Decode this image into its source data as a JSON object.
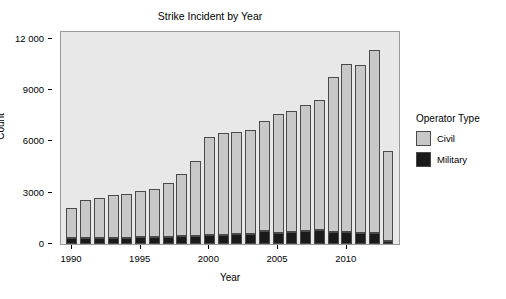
{
  "chart_data": {
    "type": "bar",
    "title": "Strike Incident by Year",
    "xlabel": "Year",
    "ylabel": "Count",
    "stacked": true,
    "grid": false,
    "xlim": [
      1989.2,
      2013.8
    ],
    "ylim": [
      0,
      12400
    ],
    "yticks": [
      0,
      3000,
      6000,
      9000,
      12000
    ],
    "ytick_labels": [
      "0",
      "3000",
      "6000",
      "9000",
      "12 000"
    ],
    "xticks": [
      1990,
      1995,
      2000,
      2005,
      2010
    ],
    "xtick_labels": [
      "1990",
      "1995",
      "2000",
      "2005",
      "2010"
    ],
    "categories": [
      1990,
      1991,
      1992,
      1993,
      1994,
      1995,
      1996,
      1997,
      1998,
      1999,
      2000,
      2001,
      2002,
      2003,
      2004,
      2005,
      2006,
      2007,
      2008,
      2009,
      2010,
      2011,
      2012,
      2013
    ],
    "series": [
      {
        "name": "Military",
        "color": "#1a1a1a",
        "values": [
          330,
          350,
          350,
          350,
          350,
          400,
          400,
          420,
          450,
          470,
          500,
          520,
          560,
          600,
          760,
          620,
          700,
          760,
          800,
          700,
          700,
          660,
          640,
          180
        ]
      },
      {
        "name": "Civil",
        "color": "#c8c8c8",
        "values": [
          1750,
          2200,
          2350,
          2500,
          2550,
          2680,
          2800,
          3150,
          3650,
          4400,
          5750,
          5950,
          6000,
          6050,
          6440,
          6980,
          7100,
          7400,
          7620,
          9080,
          9850,
          9800,
          10700,
          5270
        ]
      }
    ],
    "totals": [
      2080,
      2550,
      2700,
      2850,
      2900,
      3080,
      3200,
      3570,
      4100,
      4870,
      6250,
      6470,
      6560,
      6650,
      7200,
      7600,
      7800,
      8160,
      8420,
      9780,
      10550,
      10460,
      11340,
      5450
    ]
  },
  "legend": {
    "title": "Operator Type",
    "entries": [
      {
        "label": "Civil",
        "color": "#c8c8c8"
      },
      {
        "label": "Military",
        "color": "#1a1a1a"
      }
    ]
  },
  "panel": {
    "background": "#e8e8e8",
    "border": "#9a9a9a"
  }
}
